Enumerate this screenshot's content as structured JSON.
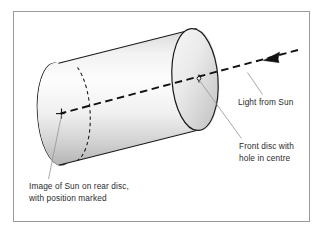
{
  "figure": {
    "type": "diagram",
    "background_color": "#ffffff",
    "frame_color": "#9a9a9a",
    "line_color": "#1a1a1a",
    "leader_color": "#9a9a9a",
    "cylinder_fill_light": "#fdfdfd",
    "cylinder_fill_dark": "#b9b9b9",
    "disc_fill_light": "#fafafa",
    "disc_fill_dark": "#c9c9c9"
  },
  "labels": {
    "light_from_sun": "Light from Sun",
    "front_disc_line1": "Front disc with",
    "front_disc_line2": "hole in centre",
    "image_of_sun_line1": "Image of Sun on rear disc,",
    "image_of_sun_line2": "with position marked"
  },
  "parts": {
    "cylinder": "cylinder-body",
    "rear_disc": "rear-disc-ellipse",
    "front_disc": "front-disc-ellipse",
    "hidden_rear_rim": "hidden-rear-rim-dashed-arc",
    "axis_ray": "sunlight-axis-dashed-ray",
    "ray_arrow": "incoming-light-arrowhead",
    "hole_marker": "pinhole-marker",
    "sun_image_marker": "sun-image-tick-marker"
  }
}
